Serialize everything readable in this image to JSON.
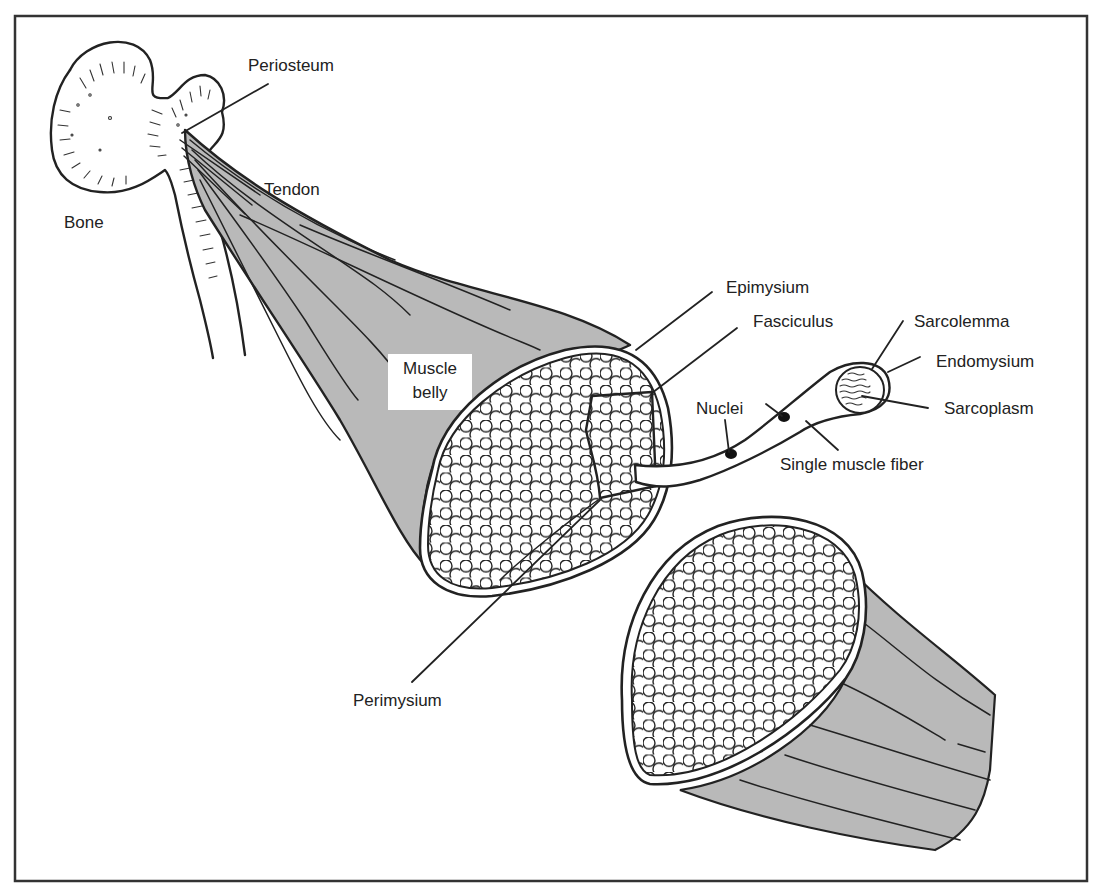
{
  "diagram": {
    "colors": {
      "muscle_fill": "#b9b9b9",
      "line": "#222222",
      "background": "#ffffff",
      "frame": "#333333"
    },
    "labels": {
      "periosteum": "Periosteum",
      "tendon": "Tendon",
      "bone": "Bone",
      "muscle_belly_line1": "Muscle",
      "muscle_belly_line2": "belly",
      "epimysium": "Epimysium",
      "fasciculus": "Fasciculus",
      "sarcolemma": "Sarcolemma",
      "endomysium": "Endomysium",
      "sarcoplasm": "Sarcoplasm",
      "nuclei": "Nuclei",
      "single_muscle_fiber": "Single muscle fiber",
      "perimysium": "Perimysium"
    },
    "components": [
      {
        "id": "bone",
        "label": "Bone",
        "type": "structure"
      },
      {
        "id": "periosteum",
        "label": "Periosteum",
        "type": "tissue"
      },
      {
        "id": "tendon",
        "label": "Tendon",
        "type": "tissue"
      },
      {
        "id": "muscle-belly",
        "label": "Muscle belly",
        "type": "structure"
      },
      {
        "id": "epimysium",
        "label": "Epimysium",
        "type": "connective-tissue"
      },
      {
        "id": "perimysium",
        "label": "Perimysium",
        "type": "connective-tissue"
      },
      {
        "id": "fasciculus",
        "label": "Fasciculus",
        "type": "bundle"
      },
      {
        "id": "single-muscle-fiber",
        "label": "Single muscle fiber",
        "type": "cell"
      },
      {
        "id": "nuclei",
        "label": "Nuclei",
        "type": "organelle"
      },
      {
        "id": "sarcolemma",
        "label": "Sarcolemma",
        "type": "membrane"
      },
      {
        "id": "endomysium",
        "label": "Endomysium",
        "type": "connective-tissue"
      },
      {
        "id": "sarcoplasm",
        "label": "Sarcoplasm",
        "type": "cytoplasm"
      }
    ]
  }
}
